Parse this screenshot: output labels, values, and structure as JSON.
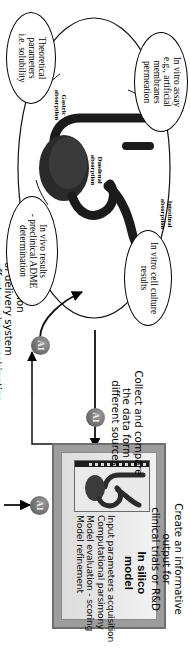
{
  "figure": {
    "orientation": "rotated-90"
  },
  "model_panel": {
    "title_line1": "In silico",
    "title_line2": "model",
    "thumbnail_name": "stomach-gi-tract-thumbnail",
    "bullets": [
      "Input parameters acquisition",
      "Computational parsimony",
      "Model evaluation - scoring",
      "Model refinement"
    ]
  },
  "captions": {
    "output": {
      "line1": "Create an informative",
      "line2": "output for",
      "line3": "clinical trials or R&D"
    },
    "collect": {
      "line1": "Collect and compare",
      "line2": "the data form",
      "line3": "different sources"
    },
    "prediction": {
      "line1": "Prediction",
      "line2": "of delivery system",
      "line3": "effect on pharmacokinetics"
    }
  },
  "ai_badges": {
    "label": "AI",
    "count": 3,
    "names": [
      "ai-badge-output",
      "ai-badge-collect",
      "ai-badge-prediction"
    ]
  },
  "ellipses": [
    {
      "name": "in-vitro-cell-culture-results",
      "lines": [
        "In vitro cell culture",
        "results"
      ]
    },
    {
      "name": "in-vitro-assay",
      "lines": [
        "In vitro assay",
        "e.g., artificial",
        "membranes",
        "permeation"
      ]
    },
    {
      "name": "in-vivo-results",
      "lines": [
        "In vivo results",
        "- preclinical ADME",
        "determination"
      ]
    },
    {
      "name": "theoretical-parameters",
      "lines": [
        "Theoretical",
        "parameters",
        "i.e. solubility"
      ]
    }
  ],
  "organ_tags": [
    {
      "name": "gastric-absorption-tag",
      "lines": [
        "Gastric",
        "absorption"
      ]
    },
    {
      "name": "duodenal-absorption-tag",
      "lines": [
        "Duodenal",
        "absorption"
      ]
    },
    {
      "name": "intestinal-absorption-tag",
      "lines": [
        "Intestinal",
        "absorption"
      ]
    }
  ],
  "colors": {
    "panel_frame": "#6f6f6f",
    "panel_fill": "#9d9d9d",
    "badge": "#6e6e6e",
    "stroke": "#000000",
    "background": "#ffffff"
  }
}
